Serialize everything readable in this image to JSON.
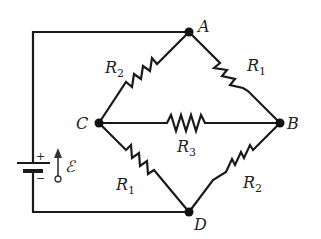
{
  "diagram": {
    "type": "circuit",
    "nodes": {
      "A": {
        "label": "A"
      },
      "B": {
        "label": "B"
      },
      "C": {
        "label": "C"
      },
      "D": {
        "label": "D"
      }
    },
    "resistors": [
      {
        "id": "AC",
        "base": "R",
        "sub": "2"
      },
      {
        "id": "AB",
        "base": "R",
        "sub": "1"
      },
      {
        "id": "CB",
        "base": "R",
        "sub": "3"
      },
      {
        "id": "CD",
        "base": "R",
        "sub": "1"
      },
      {
        "id": "BD",
        "base": "R",
        "sub": "2"
      }
    ],
    "battery": {
      "emf_symbol": "ℰ",
      "plus": "+",
      "minus": "−"
    },
    "colors": {
      "wire": "#1a1a1a",
      "background": "#ffffff"
    }
  }
}
